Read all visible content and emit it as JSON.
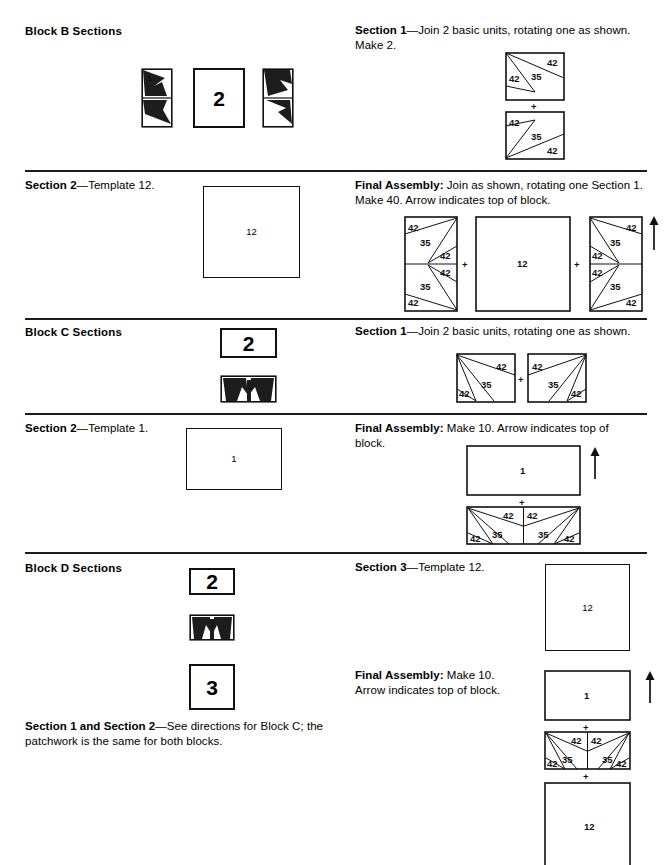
{
  "page": {
    "width": 670,
    "height": 865,
    "background": "#ffffff",
    "ink": "#111111"
  },
  "labels": {
    "patch_42": "42",
    "patch_35": "35",
    "template_1": "1",
    "template_2": "2",
    "template_3": "3",
    "template_12": "12",
    "plus": "+"
  },
  "sections": [
    {
      "id": "block-b",
      "left_heading": "Block B Sections",
      "right_heading_bold": "Section 1",
      "right_body": "—Join 2 basic units, rotating one as shown. Make 2.",
      "rule_above": false
    },
    {
      "id": "block-b-section-2",
      "left_heading_bold": "Section 2",
      "left_body": "—Template 12.",
      "right_heading_bold": "Final Assembly:",
      "right_body": " Join as shown, rotating one Section 1. Make 40. Arrow indicates top of block.",
      "rule_above": true
    },
    {
      "id": "block-c",
      "left_heading": "Block C Sections",
      "right_heading_bold": "Section 1",
      "right_body": "—Join 2 basic units, rotating one as shown.",
      "rule_above": true
    },
    {
      "id": "block-c-section-2",
      "left_heading_bold": "Section 2",
      "left_body": "—Template 1.",
      "right_heading_bold": "Final Assembly:",
      "right_body": " Make 10. Arrow indicates top of block.",
      "rule_above": true
    },
    {
      "id": "block-d",
      "left_heading": "Block D Sections",
      "right_heading_bold": "Section 3",
      "right_body": "—Template 12.",
      "rule_above": true
    },
    {
      "id": "block-d-final",
      "right_heading_bold": "Final Assembly:",
      "right_body": " Make 10. Arrow indicates top of block.",
      "rule_above": false
    },
    {
      "id": "block-d-note",
      "left_heading_bold": "Section 1 and Section 2",
      "left_body": "—See directions for Block C; the patchwork is the same for both blocks.",
      "rule_above": false
    }
  ],
  "block_b": {
    "swatches": [
      {
        "name": "pieced-unit-left",
        "label": "1",
        "kind": "pieced-tall"
      },
      {
        "name": "template-square",
        "label": "2",
        "kind": "plain"
      },
      {
        "name": "pieced-unit-right",
        "label": "1",
        "kind": "pieced-tall-mirror"
      }
    ],
    "section1_unit": {
      "top_labels": [
        "42",
        "35",
        "42"
      ],
      "bottom_labels": [
        "42",
        "35",
        "42"
      ]
    },
    "section2_template": "12",
    "final_assembly": {
      "parts": [
        "Section 1 unit",
        "Template 12 square",
        "Section 1 unit rotated"
      ],
      "center_label": "12",
      "joiner": "+",
      "arrow": "up"
    }
  },
  "block_c": {
    "swatches": [
      {
        "name": "template-rect",
        "label": "2",
        "kind": "plain"
      },
      {
        "name": "pieced-unit",
        "label": "1",
        "kind": "pieced-wide"
      }
    ],
    "section1_pair": {
      "left_labels": [
        "42",
        "35",
        "42"
      ],
      "right_labels": [
        "42",
        "35",
        "42"
      ],
      "joiner": "+"
    },
    "section2_template": "1",
    "final_assembly": {
      "top_label": "1",
      "bottom_labels": [
        "42",
        "42",
        "42",
        "35",
        "35",
        "42"
      ],
      "joiner": "+",
      "arrow": "up"
    }
  },
  "block_d": {
    "swatches": [
      {
        "name": "template-rect",
        "label": "2",
        "kind": "plain"
      },
      {
        "name": "pieced-unit",
        "label": "1",
        "kind": "pieced-wide"
      },
      {
        "name": "template-square",
        "label": "3",
        "kind": "plain"
      }
    ],
    "section3_template": "12",
    "final_assembly": {
      "top_label": "1",
      "middle_labels": [
        "42",
        "42",
        "42",
        "35",
        "35",
        "42"
      ],
      "bottom_label": "12",
      "joiner": "+",
      "arrow": "up"
    }
  }
}
